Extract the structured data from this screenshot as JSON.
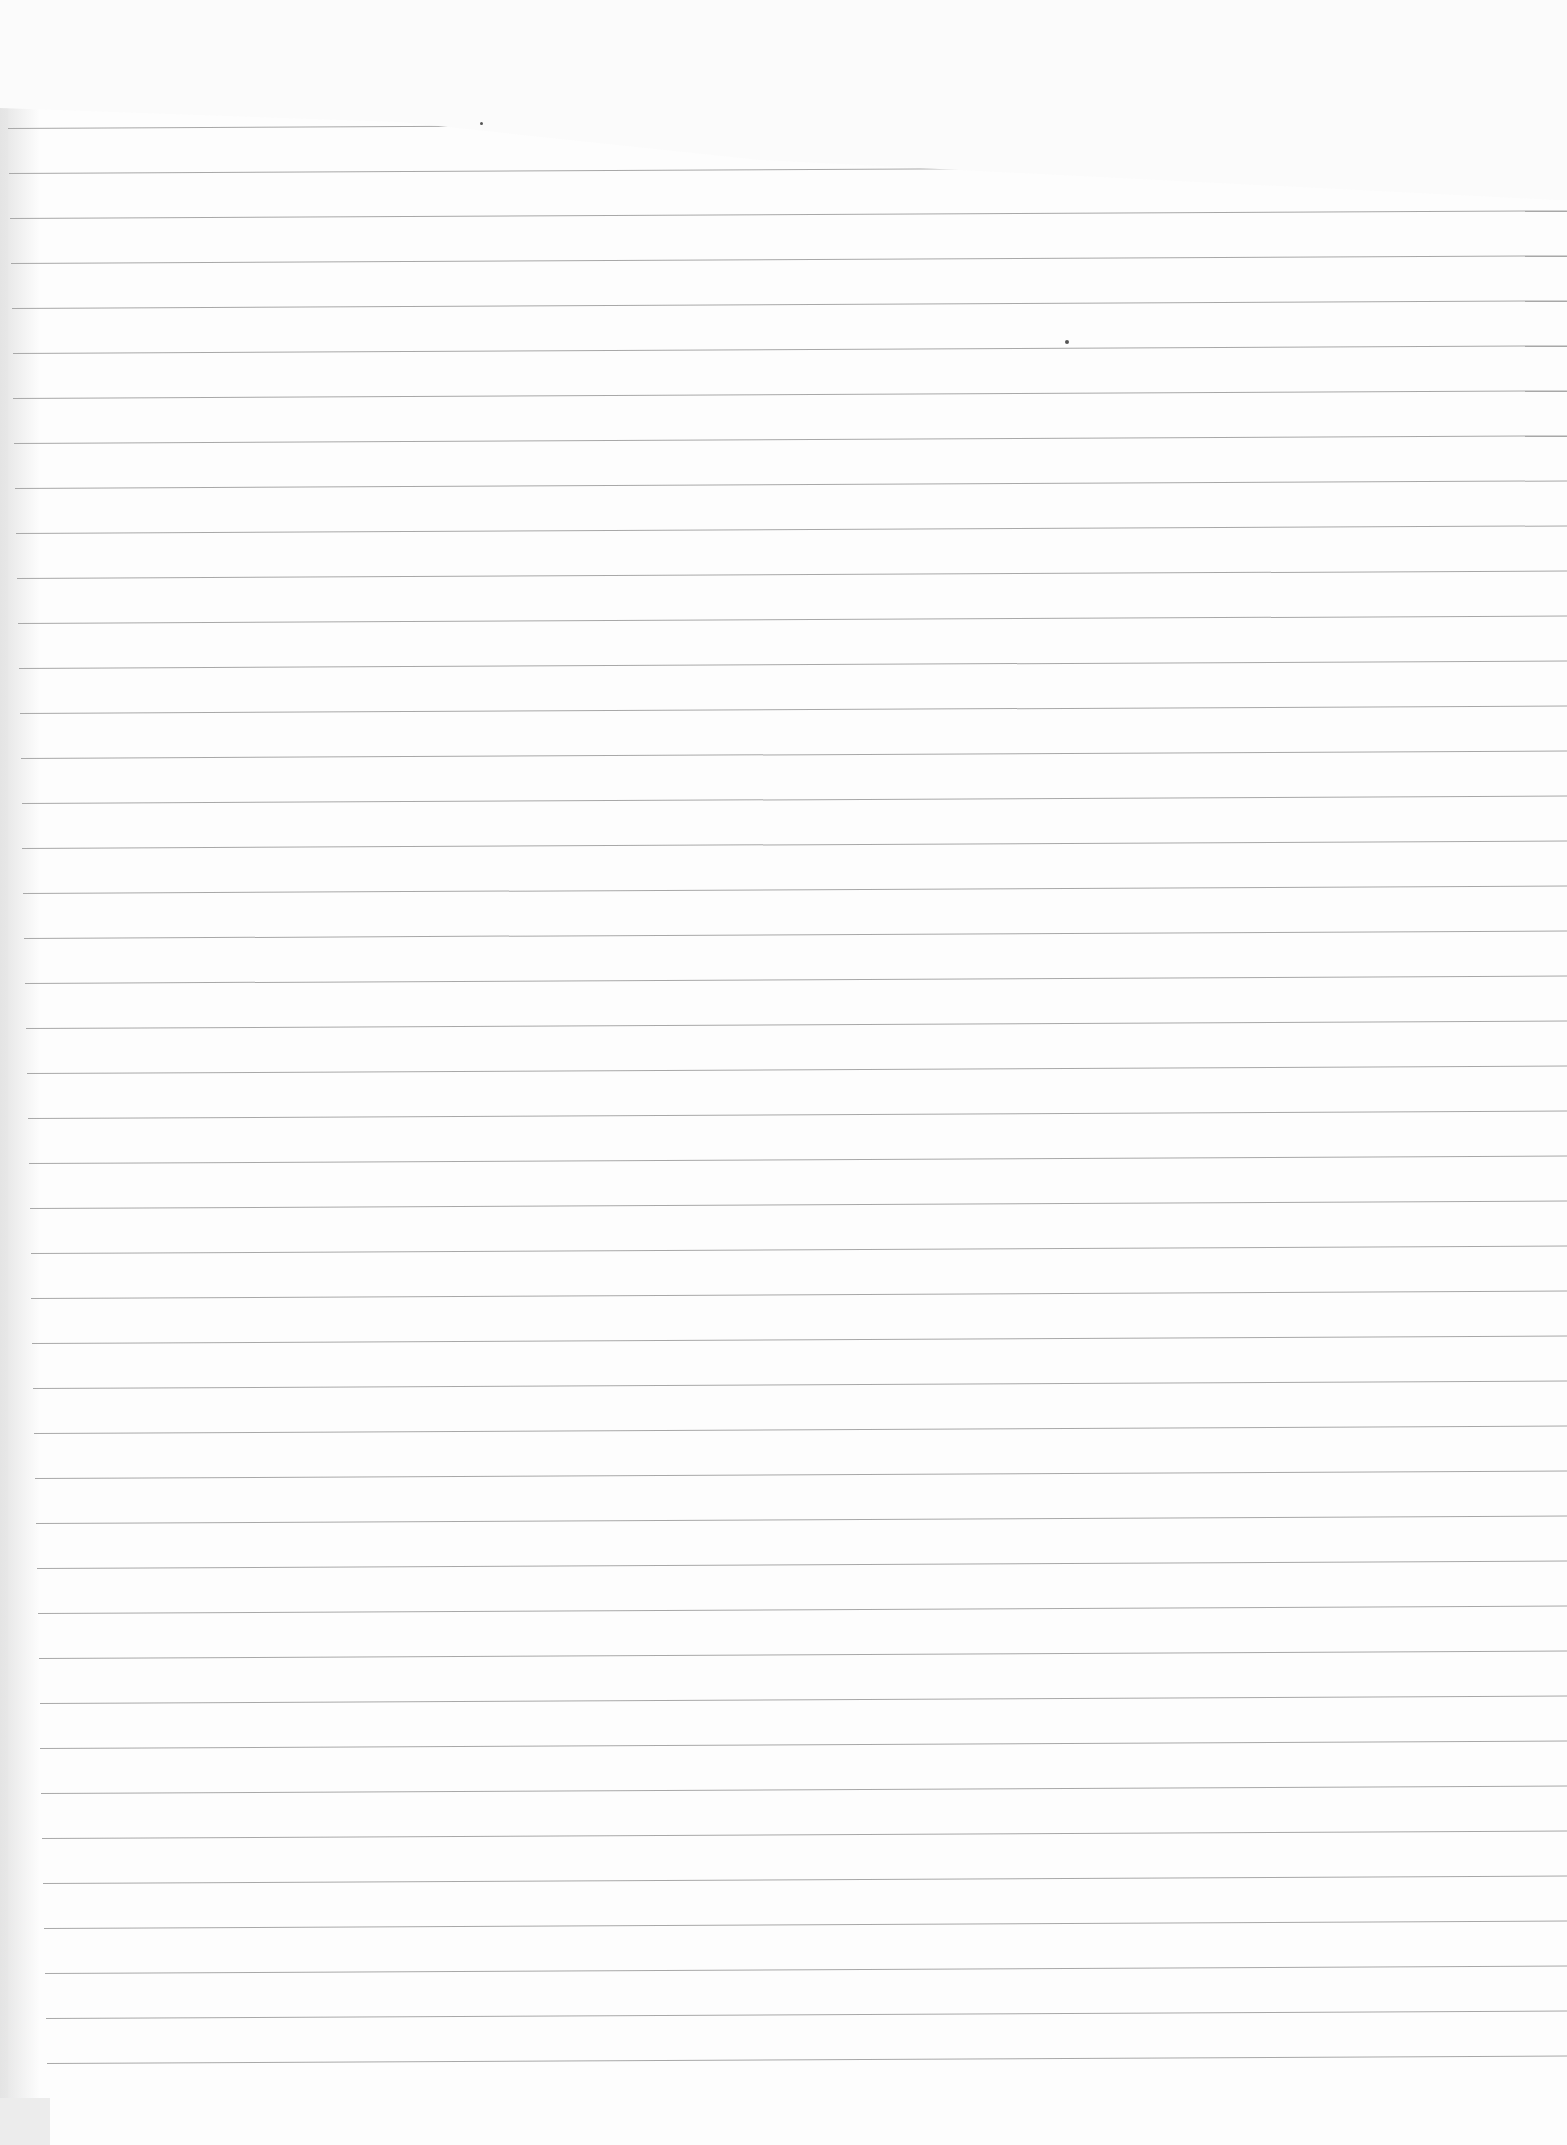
{
  "document": {
    "type": "ruled-notebook-paper",
    "text": "",
    "line_count": 44,
    "first_line_y": 128,
    "line_spacing_px": 45,
    "line_color": "#a8a8a8",
    "paper_color": "#fdfdfd"
  }
}
